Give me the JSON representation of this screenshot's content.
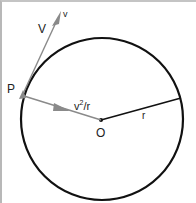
{
  "diagram": {
    "labels": {
      "point": "P",
      "velocity_big": "V",
      "velocity_small": "v",
      "accel_base": "v",
      "accel_sup": "2",
      "accel_tail": "/r",
      "center": "O",
      "radius": "r"
    },
    "colors": {
      "circle": "#111111",
      "arrow": "#8a8a8a",
      "radius_line": "#111111",
      "text": "#222222"
    }
  }
}
